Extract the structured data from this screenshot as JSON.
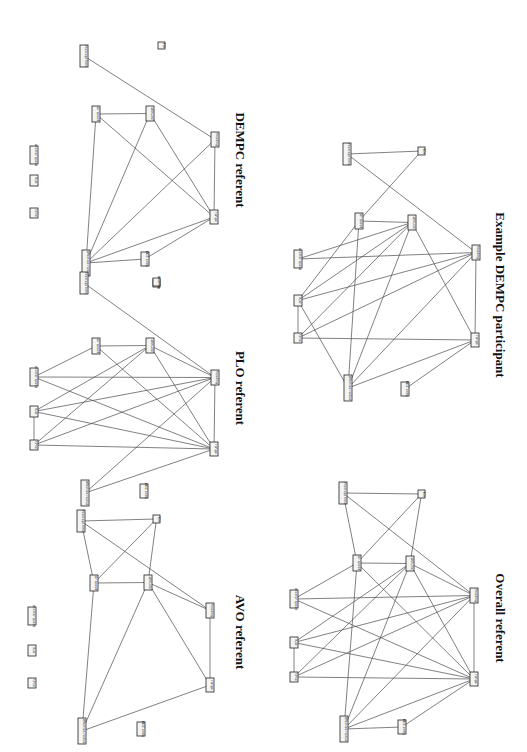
{
  "figure": {
    "orientation": "rotated 90 degrees clockwise",
    "panels": [
      {
        "id": "dempc",
        "title": "DEMPC referent",
        "title_pos": [
          236,
          160
        ],
        "nodes": [
          {
            "id": "intercept_time",
            "label": "intercept time",
            "x": 80,
            "y": 45,
            "w": 8,
            "h": 22
          },
          {
            "id": "toi",
            "label": "TOI",
            "x": 158,
            "y": 42,
            "w": 7,
            "h": 7
          },
          {
            "id": "air_speed",
            "label": "air speed",
            "x": 92,
            "y": 106,
            "w": 8,
            "h": 16
          },
          {
            "id": "altitude",
            "label": "altitude",
            "x": 146,
            "y": 106,
            "w": 8,
            "h": 15
          },
          {
            "id": "heading",
            "label": "heading",
            "x": 211,
            "y": 132,
            "w": 8,
            "h": 15
          },
          {
            "id": "shooter_speed",
            "label": "shooter speed",
            "x": 30,
            "y": 146,
            "w": 8,
            "h": 18
          },
          {
            "id": "fuel",
            "label": "fuel",
            "x": 30,
            "y": 175,
            "w": 8,
            "h": 11
          },
          {
            "id": "time",
            "label": "time",
            "x": 30,
            "y": 208,
            "w": 8,
            "h": 10
          },
          {
            "id": "range",
            "label": "range",
            "x": 210,
            "y": 210,
            "w": 8,
            "h": 14
          },
          {
            "id": "effective_radius",
            "label": "effective radius",
            "x": 82,
            "y": 250,
            "w": 8,
            "h": 26
          },
          {
            "id": "bdz_entry",
            "label": "BDZ entry",
            "x": 141,
            "y": 252,
            "w": 8,
            "h": 14
          },
          {
            "id": "bearing",
            "label": "bearing",
            "x": 153,
            "y": 279,
            "w": 7,
            "h": 8
          }
        ],
        "edges": [
          [
            "intercept_time",
            "heading"
          ],
          [
            "air_speed",
            "altitude"
          ],
          [
            "air_speed",
            "range"
          ],
          [
            "air_speed",
            "effective_radius"
          ],
          [
            "altitude",
            "effective_radius"
          ],
          [
            "altitude",
            "range"
          ],
          [
            "heading",
            "range"
          ],
          [
            "heading",
            "effective_radius"
          ],
          [
            "range",
            "effective_radius"
          ],
          [
            "range",
            "bdz_entry"
          ],
          [
            "effective_radius",
            "bdz_entry"
          ]
        ]
      },
      {
        "id": "plo",
        "title": "PLO referent",
        "title_pos": [
          236,
          388
        ],
        "nodes": [
          {
            "id": "intercept_time",
            "label": "intercept time",
            "x": 80,
            "y": 272,
            "w": 8,
            "h": 22
          },
          {
            "id": "bearing",
            "label": "bearing",
            "x": 153,
            "y": 278,
            "w": 7,
            "h": 8
          },
          {
            "id": "air_speed",
            "label": "air speed",
            "x": 92,
            "y": 338,
            "w": 8,
            "h": 16
          },
          {
            "id": "altitude",
            "label": "altitude",
            "x": 146,
            "y": 338,
            "w": 8,
            "h": 15
          },
          {
            "id": "shooter_speed",
            "label": "shooter speed",
            "x": 30,
            "y": 368,
            "w": 8,
            "h": 18
          },
          {
            "id": "heading",
            "label": "heading",
            "x": 211,
            "y": 370,
            "w": 8,
            "h": 15
          },
          {
            "id": "fuel",
            "label": "fuel",
            "x": 30,
            "y": 406,
            "w": 8,
            "h": 11
          },
          {
            "id": "time",
            "label": "time",
            "x": 30,
            "y": 440,
            "w": 8,
            "h": 10
          },
          {
            "id": "range",
            "label": "range",
            "x": 210,
            "y": 442,
            "w": 8,
            "h": 14
          },
          {
            "id": "effective_radius",
            "label": "effective radius",
            "x": 81,
            "y": 480,
            "w": 8,
            "h": 26
          },
          {
            "id": "bdz_entry",
            "label": "BDZ entry",
            "x": 140,
            "y": 484,
            "w": 8,
            "h": 14
          }
        ],
        "edges": [
          [
            "intercept_time",
            "heading"
          ],
          [
            "air_speed",
            "altitude"
          ],
          [
            "air_speed",
            "shooter_speed"
          ],
          [
            "air_speed",
            "range"
          ],
          [
            "altitude",
            "fuel"
          ],
          [
            "altitude",
            "time"
          ],
          [
            "altitude",
            "heading"
          ],
          [
            "altitude",
            "range"
          ],
          [
            "shooter_speed",
            "heading"
          ],
          [
            "shooter_speed",
            "range"
          ],
          [
            "fuel",
            "heading"
          ],
          [
            "fuel",
            "range"
          ],
          [
            "fuel",
            "time"
          ],
          [
            "time",
            "heading"
          ],
          [
            "time",
            "range"
          ],
          [
            "heading",
            "range"
          ],
          [
            "heading",
            "effective_radius"
          ],
          [
            "range",
            "effective_radius"
          ]
        ]
      },
      {
        "id": "avo",
        "title": "AVO referent",
        "title_pos": [
          236,
          632
        ],
        "nodes": [
          {
            "id": "intercept_time",
            "label": "intercept time",
            "x": 77,
            "y": 510,
            "w": 8,
            "h": 22
          },
          {
            "id": "toi",
            "label": "TOI",
            "x": 153,
            "y": 515,
            "w": 7,
            "h": 8
          },
          {
            "id": "air_speed",
            "label": "air speed",
            "x": 90,
            "y": 575,
            "w": 8,
            "h": 16
          },
          {
            "id": "altitude",
            "label": "altitude",
            "x": 144,
            "y": 575,
            "w": 8,
            "h": 15
          },
          {
            "id": "shooter_speed",
            "label": "shooter speed",
            "x": 28,
            "y": 607,
            "w": 8,
            "h": 18
          },
          {
            "id": "heading",
            "label": "heading",
            "x": 206,
            "y": 603,
            "w": 8,
            "h": 15
          },
          {
            "id": "fuel",
            "label": "fuel",
            "x": 28,
            "y": 645,
            "w": 8,
            "h": 11
          },
          {
            "id": "time",
            "label": "time",
            "x": 28,
            "y": 678,
            "w": 8,
            "h": 10
          },
          {
            "id": "range",
            "label": "range",
            "x": 206,
            "y": 678,
            "w": 8,
            "h": 14
          },
          {
            "id": "effective_radius",
            "label": "effective radius",
            "x": 78,
            "y": 718,
            "w": 8,
            "h": 26
          },
          {
            "id": "bdz_entry",
            "label": "BDZ entry",
            "x": 137,
            "y": 722,
            "w": 8,
            "h": 14
          }
        ],
        "edges": [
          [
            "intercept_time",
            "toi"
          ],
          [
            "intercept_time",
            "air_speed"
          ],
          [
            "intercept_time",
            "heading"
          ],
          [
            "toi",
            "air_speed"
          ],
          [
            "toi",
            "altitude"
          ],
          [
            "air_speed",
            "altitude"
          ],
          [
            "air_speed",
            "effective_radius"
          ],
          [
            "altitude",
            "heading"
          ],
          [
            "altitude",
            "range"
          ],
          [
            "altitude",
            "effective_radius"
          ],
          [
            "heading",
            "range"
          ],
          [
            "range",
            "effective_radius"
          ]
        ]
      },
      {
        "id": "example_dempc",
        "title": "Example DEMPC participant",
        "title_pos": [
          496,
          295
        ],
        "nodes": [
          {
            "id": "intercept_time",
            "label": "intercept time",
            "x": 343,
            "y": 143,
            "w": 8,
            "h": 22
          },
          {
            "id": "toi",
            "label": "TOI",
            "x": 418,
            "y": 147,
            "w": 7,
            "h": 8
          },
          {
            "id": "air_speed",
            "label": "air speed",
            "x": 355,
            "y": 213,
            "w": 8,
            "h": 16
          },
          {
            "id": "altitude",
            "label": "altitude",
            "x": 408,
            "y": 215,
            "w": 8,
            "h": 15
          },
          {
            "id": "shooter_speed",
            "label": "shooter speed",
            "x": 294,
            "y": 250,
            "w": 8,
            "h": 18
          },
          {
            "id": "heading",
            "label": "heading",
            "x": 472,
            "y": 245,
            "w": 8,
            "h": 15
          },
          {
            "id": "fuel",
            "label": "fuel",
            "x": 294,
            "y": 295,
            "w": 8,
            "h": 11
          },
          {
            "id": "time",
            "label": "time",
            "x": 294,
            "y": 333,
            "w": 8,
            "h": 10
          },
          {
            "id": "range",
            "label": "range",
            "x": 471,
            "y": 333,
            "w": 8,
            "h": 14
          },
          {
            "id": "effective_radius",
            "label": "effective radius",
            "x": 344,
            "y": 375,
            "w": 8,
            "h": 26
          },
          {
            "id": "bdz_entry",
            "label": "BDZ entry",
            "x": 401,
            "y": 382,
            "w": 8,
            "h": 14
          }
        ],
        "edges": [
          [
            "intercept_time",
            "toi"
          ],
          [
            "intercept_time",
            "heading"
          ],
          [
            "toi",
            "air_speed"
          ],
          [
            "air_speed",
            "altitude"
          ],
          [
            "air_speed",
            "fuel"
          ],
          [
            "air_speed",
            "effective_radius"
          ],
          [
            "altitude",
            "shooter_speed"
          ],
          [
            "altitude",
            "fuel"
          ],
          [
            "altitude",
            "time"
          ],
          [
            "altitude",
            "range"
          ],
          [
            "altitude",
            "effective_radius"
          ],
          [
            "shooter_speed",
            "heading"
          ],
          [
            "fuel",
            "heading"
          ],
          [
            "fuel",
            "time"
          ],
          [
            "fuel",
            "effective_radius"
          ],
          [
            "time",
            "heading"
          ],
          [
            "time",
            "range"
          ],
          [
            "heading",
            "range"
          ],
          [
            "heading",
            "effective_radius"
          ],
          [
            "range",
            "effective_radius"
          ],
          [
            "range",
            "bdz_entry"
          ]
        ]
      },
      {
        "id": "overall",
        "title": "Overall referent",
        "title_pos": [
          496,
          618
        ],
        "nodes": [
          {
            "id": "intercept_time",
            "label": "intercept time",
            "x": 339,
            "y": 482,
            "w": 8,
            "h": 22
          },
          {
            "id": "toi",
            "label": "TOI",
            "x": 418,
            "y": 490,
            "w": 7,
            "h": 8
          },
          {
            "id": "air_speed",
            "label": "air speed",
            "x": 353,
            "y": 555,
            "w": 8,
            "h": 16
          },
          {
            "id": "altitude",
            "label": "altitude",
            "x": 406,
            "y": 556,
            "w": 8,
            "h": 15
          },
          {
            "id": "shooter_speed",
            "label": "shooter speed",
            "x": 290,
            "y": 590,
            "w": 8,
            "h": 18
          },
          {
            "id": "heading",
            "label": "heading",
            "x": 470,
            "y": 588,
            "w": 8,
            "h": 15
          },
          {
            "id": "fuel",
            "label": "fuel",
            "x": 290,
            "y": 637,
            "w": 8,
            "h": 11
          },
          {
            "id": "time",
            "label": "time",
            "x": 290,
            "y": 672,
            "w": 8,
            "h": 10
          },
          {
            "id": "range",
            "label": "range",
            "x": 470,
            "y": 672,
            "w": 8,
            "h": 14
          },
          {
            "id": "effective_radius",
            "label": "effective radius",
            "x": 340,
            "y": 716,
            "w": 8,
            "h": 26
          },
          {
            "id": "bdz_entry",
            "label": "BDZ entry",
            "x": 398,
            "y": 720,
            "w": 8,
            "h": 14
          }
        ],
        "edges": [
          [
            "intercept_time",
            "toi"
          ],
          [
            "intercept_time",
            "air_speed"
          ],
          [
            "intercept_time",
            "heading"
          ],
          [
            "toi",
            "air_speed"
          ],
          [
            "toi",
            "altitude"
          ],
          [
            "air_speed",
            "altitude"
          ],
          [
            "air_speed",
            "shooter_speed"
          ],
          [
            "air_speed",
            "range"
          ],
          [
            "air_speed",
            "effective_radius"
          ],
          [
            "altitude",
            "fuel"
          ],
          [
            "altitude",
            "time"
          ],
          [
            "altitude",
            "heading"
          ],
          [
            "altitude",
            "range"
          ],
          [
            "altitude",
            "effective_radius"
          ],
          [
            "shooter_speed",
            "heading"
          ],
          [
            "shooter_speed",
            "range"
          ],
          [
            "fuel",
            "heading"
          ],
          [
            "fuel",
            "range"
          ],
          [
            "fuel",
            "time"
          ],
          [
            "time",
            "heading"
          ],
          [
            "time",
            "range"
          ],
          [
            "heading",
            "range"
          ],
          [
            "heading",
            "effective_radius"
          ],
          [
            "range",
            "effective_radius"
          ],
          [
            "range",
            "bdz_entry"
          ],
          [
            "effective_radius",
            "bdz_entry"
          ]
        ]
      }
    ]
  }
}
